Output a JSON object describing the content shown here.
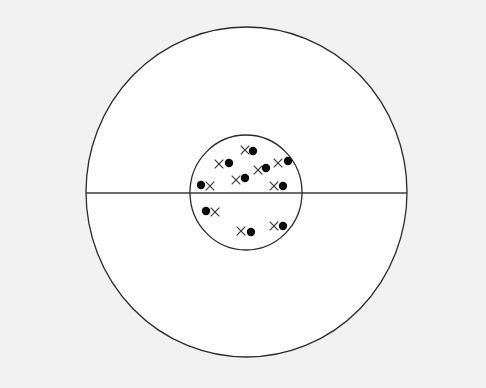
{
  "diagram": {
    "type": "concentric-target",
    "background_color": "#f1f1f1",
    "fill_color": "#ffffff",
    "stroke_color": "#2a2a2a",
    "outer_circle": {
      "cx": 246.5,
      "cy": 192,
      "rx": 160.5,
      "ry": 165
    },
    "inner_circle": {
      "cx": 246,
      "cy": 192.5,
      "rx": 56,
      "ry": 57.5
    },
    "divider_line": {
      "x1": 86,
      "y1": 193,
      "x2": 407,
      "y2": 193
    },
    "marker_pairs": [
      {
        "cross": [
          219,
          164
        ],
        "dot": [
          229,
          163
        ]
      },
      {
        "cross": [
          245,
          150
        ],
        "dot": [
          253,
          151
        ]
      },
      {
        "cross": [
          236,
          180
        ],
        "dot": [
          245,
          178
        ]
      },
      {
        "cross": [
          258,
          170
        ],
        "dot": [
          266,
          168
        ]
      },
      {
        "cross": [
          278,
          163
        ],
        "dot": [
          288,
          161
        ]
      },
      {
        "cross": [
          274,
          186
        ],
        "dot": [
          283,
          186
        ]
      },
      {
        "cross": [
          210,
          186
        ],
        "dot": [
          201,
          185
        ]
      },
      {
        "cross": [
          215,
          212
        ],
        "dot": [
          206,
          211
        ]
      },
      {
        "cross": [
          241,
          231
        ],
        "dot": [
          251,
          232
        ]
      },
      {
        "cross": [
          274,
          226
        ],
        "dot": [
          283,
          226
        ]
      }
    ],
    "legend": {
      "dot_symbol": "filled-circle",
      "cross_symbol": "x-mark"
    }
  }
}
